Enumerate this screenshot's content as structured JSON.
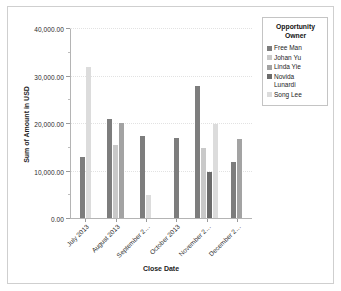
{
  "chart_data": {
    "type": "bar",
    "title": "",
    "xlabel": "Close Date",
    "ylabel": "Sum of Amount in USD",
    "ylim": [
      0,
      40000
    ],
    "ytick_labels": [
      "0.00",
      "10,000.00",
      "20,000.00",
      "30,000.00",
      "40,000.00"
    ],
    "ytick_values": [
      0,
      10000,
      20000,
      30000,
      40000
    ],
    "yminor_step": 5000,
    "grid": true,
    "legend_position": "right",
    "legend_title": "Opportunity Owner",
    "categories": [
      "July 2013",
      "August 2013",
      "September 2…",
      "October 2013",
      "November 2…",
      "December 2…"
    ],
    "series": [
      {
        "name": "Free Man",
        "color": "#7d7d7d",
        "values": [
          13000,
          21000,
          17500,
          17000,
          28000,
          11900
        ]
      },
      {
        "name": "Johan Yu",
        "color": "#c9c9c9",
        "values": [
          null,
          15500,
          null,
          null,
          15000,
          null
        ]
      },
      {
        "name": "Linda Yie",
        "color": "#a3a3a3",
        "values": [
          null,
          20200,
          null,
          null,
          null,
          16900
        ]
      },
      {
        "name": "Novida Lunardi",
        "color": "#6b6b6b",
        "values": [
          null,
          null,
          null,
          null,
          9900,
          null
        ]
      },
      {
        "name": "Song Lee",
        "color": "#dcdcdc",
        "values": [
          32000,
          null,
          5000,
          null,
          20000,
          null
        ]
      }
    ]
  },
  "legend": {
    "title_line1": "Opportunity",
    "title_line2": "Owner",
    "items": [
      {
        "label": "Free Man",
        "color": "#7d7d7d"
      },
      {
        "label": "Johan Yu",
        "color": "#c9c9c9"
      },
      {
        "label": "Linda Yie",
        "color": "#a3a3a3"
      },
      {
        "label": "Novida\nLunardi",
        "color": "#6b6b6b"
      },
      {
        "label": "Song Lee",
        "color": "#dcdcdc"
      }
    ]
  },
  "axes": {
    "y_title": "Sum of Amount in USD",
    "x_title": "Close Date"
  }
}
